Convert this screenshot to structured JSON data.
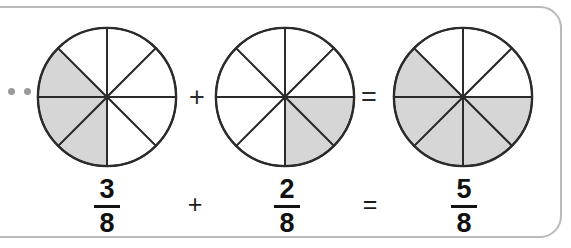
{
  "frame": {
    "border_color": "#b9b9b9",
    "background": "#ffffff"
  },
  "bullets": {
    "name": "bullet-dots",
    "count": 2,
    "color": "#9a9a9a"
  },
  "colors": {
    "shaded_fill": "#d6d6d6",
    "unshaded_fill": "#ffffff",
    "stroke": "#2b2b2b",
    "text": "#111111"
  },
  "equation": {
    "expression": "3/8 + 2/8 = 5/8",
    "denominator": 8,
    "operators": {
      "plus": "+",
      "equals": "="
    }
  },
  "circles": [
    {
      "name": "circle-three-eighths",
      "total_sectors": 8,
      "shaded_sectors": 3,
      "shaded_indices": [
        4,
        5,
        6
      ],
      "label": "3/8"
    },
    {
      "name": "circle-two-eighths",
      "total_sectors": 8,
      "shaded_sectors": 2,
      "shaded_indices": [
        2,
        3
      ],
      "label": "2/8"
    },
    {
      "name": "circle-five-eighths",
      "total_sectors": 8,
      "shaded_sectors": 5,
      "shaded_indices": [
        2,
        3,
        4,
        5,
        6
      ],
      "label": "5/8"
    }
  ],
  "fractions": [
    {
      "name": "fraction-first",
      "numerator": "3",
      "denominator": "8"
    },
    {
      "name": "fraction-second",
      "numerator": "2",
      "denominator": "8"
    },
    {
      "name": "fraction-result",
      "numerator": "5",
      "denominator": "8"
    }
  ],
  "operators_mid": [
    {
      "name": "plus-operator-circles",
      "symbol": "+"
    },
    {
      "name": "equals-operator-circles",
      "symbol": "="
    }
  ],
  "operators_bottom": [
    {
      "name": "plus-operator-fractions",
      "symbol": "+"
    },
    {
      "name": "equals-operator-fractions",
      "symbol": "="
    }
  ],
  "chart_data": {
    "type": "pie",
    "title": "",
    "charts": [
      {
        "label": "3/8",
        "slices": 8,
        "filled": 3,
        "values": [
          1,
          1,
          1,
          1,
          1,
          1,
          1,
          1
        ]
      },
      {
        "label": "2/8",
        "slices": 8,
        "filled": 2,
        "values": [
          1,
          1,
          1,
          1,
          1,
          1,
          1,
          1
        ]
      },
      {
        "label": "5/8",
        "slices": 8,
        "filled": 5,
        "values": [
          1,
          1,
          1,
          1,
          1,
          1,
          1,
          1
        ]
      }
    ],
    "legend": [],
    "grid": false
  }
}
